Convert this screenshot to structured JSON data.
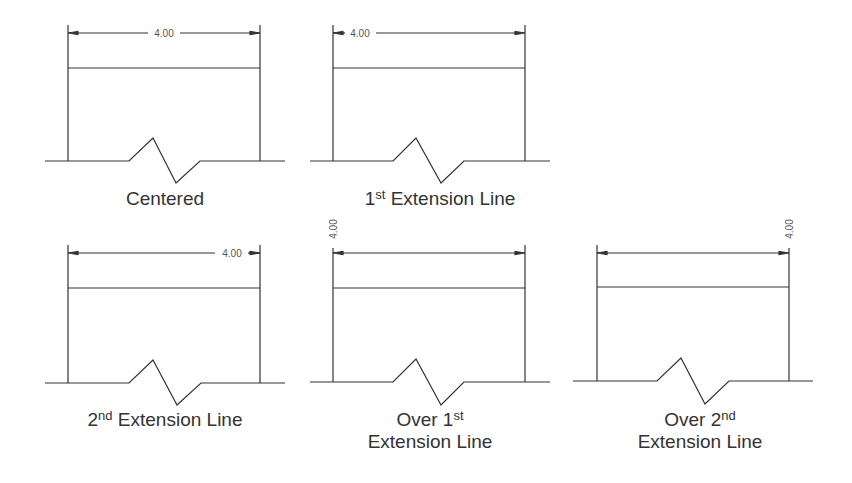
{
  "figure": {
    "dimension_value": "4.00",
    "line_color": "#333333",
    "panels": [
      {
        "id": "centered",
        "caption_lines": [
          {
            "text": "Centered"
          }
        ],
        "text_position": "centered"
      },
      {
        "id": "first-extension",
        "caption_lines": [
          {
            "pre": "1",
            "sup": "st",
            "post": " Extension Line"
          }
        ],
        "text_position": "near-first-extension-line"
      },
      {
        "id": "second-extension",
        "caption_lines": [
          {
            "pre": "2",
            "sup": "nd",
            "post": " Extension Line"
          }
        ],
        "text_position": "near-second-extension-line"
      },
      {
        "id": "over-first",
        "caption_lines": [
          {
            "pre": "Over 1",
            "sup": "st",
            "post": ""
          },
          {
            "text": "Extension Line"
          }
        ],
        "text_position": "over-first-extension-line (rotated)"
      },
      {
        "id": "over-second",
        "caption_lines": [
          {
            "pre": "Over 2",
            "sup": "nd",
            "post": ""
          },
          {
            "text": "Extension Line"
          }
        ],
        "text_position": "over-second-extension-line (rotated)"
      }
    ]
  }
}
